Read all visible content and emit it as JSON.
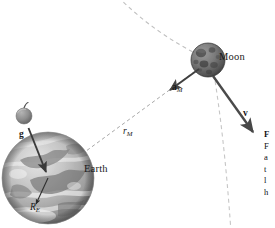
{
  "figure": {
    "background_color": "#ffffff",
    "width": 275,
    "height": 228,
    "bodies": [
      {
        "name": "Earth",
        "label": "Earth",
        "kind": "planet",
        "center_x": 48,
        "center_y": 178,
        "radius": 46,
        "fill_color": "#b9b9b9",
        "shading": "grayscale photographic globe with continents and cloud bands"
      },
      {
        "name": "Moon",
        "label": "Moon",
        "kind": "satellite",
        "center_x": 208,
        "center_y": 60,
        "radius": 17,
        "fill_color": "#6e6e6e",
        "shading": "dark gray cratered sphere"
      },
      {
        "name": "apple",
        "label": "",
        "kind": "apple",
        "center_x": 24,
        "center_y": 116,
        "radius": 8,
        "fill_color": "#8f8f8f",
        "shading": "small gray apple with stem"
      }
    ],
    "vectors": [
      {
        "name": "g",
        "label": "g",
        "style": "bold-italic-vector",
        "description": "free-fall acceleration arrow from apple toward Earth's center",
        "color": "#3d3d3d"
      },
      {
        "name": "a_M",
        "label": "a",
        "subscript": "M",
        "style": "bold-italic-vector",
        "description": "centripetal acceleration of the Moon, pointing toward Earth",
        "color": "#3d3d3d"
      },
      {
        "name": "v",
        "label": "v",
        "subscript": "",
        "style": "bold-italic-vector",
        "description": "Moon's orbital velocity, tangent to the orbit",
        "color": "#4a4a4a"
      }
    ],
    "distances": [
      {
        "name": "r_M",
        "label": "r",
        "subscript": "M",
        "style": "italic",
        "description": "Earth-Moon center-to-center distance, dashed line",
        "color": "#9a9a9a"
      },
      {
        "name": "R_E",
        "label": "R",
        "subscript": "E",
        "style": "italic",
        "description": "Earth's radius, short arrow inside the globe",
        "color": "#2b2b2b"
      }
    ],
    "orbit": {
      "name": "moon-orbit",
      "style": "dashed",
      "color": "#bdbdbd",
      "description": "dashed elliptical orbital path of the Moon passing through the Moon and continuing downward off-frame"
    }
  },
  "caption": {
    "clipped": true,
    "lines": [
      "F",
      "F",
      "a",
      "t",
      "l",
      "h"
    ]
  }
}
